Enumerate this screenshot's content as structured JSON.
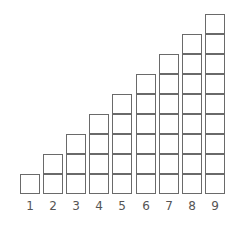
{
  "figure": {
    "columns": [
      {
        "label": "1",
        "squares": 1
      },
      {
        "label": "2",
        "squares": 2
      },
      {
        "label": "3",
        "squares": 3
      },
      {
        "label": "4",
        "squares": 4
      },
      {
        "label": "5",
        "squares": 5
      },
      {
        "label": "6",
        "squares": 6
      },
      {
        "label": "7",
        "squares": 7
      },
      {
        "label": "8",
        "squares": 8
      },
      {
        "label": "9",
        "squares": 9
      }
    ],
    "colors": {
      "stroke": "#6a6a6a",
      "fill": "#ffffff",
      "label": "#555555"
    }
  }
}
